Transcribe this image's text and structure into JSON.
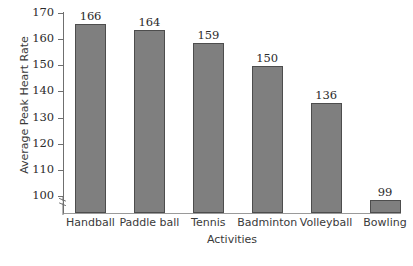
{
  "chart_data": {
    "type": "bar",
    "title": "",
    "subtitle": "",
    "xlabel": "Activities",
    "ylabel": "Average Peak Heart Rate",
    "categories": [
      "Handball",
      "Paddle ball",
      "Tennis",
      "Badminton",
      "Volleyball",
      "Bowling"
    ],
    "values": [
      166,
      164,
      159,
      150,
      136,
      99
    ],
    "value_labels": [
      "166",
      "164",
      "159",
      "150",
      "136",
      "99"
    ],
    "yticks": [
      100,
      110,
      120,
      130,
      140,
      150,
      160,
      170
    ],
    "ytick_labels": [
      "100",
      "110",
      "120",
      "130",
      "140",
      "150",
      "160",
      "170"
    ],
    "ylim": [
      93,
      170
    ],
    "axis_break": true,
    "axis_break_note": "y-axis broken below 100",
    "grid": false,
    "legend": null,
    "legend_position": "none",
    "bar_color": "#7f7f7f",
    "bar_edge_color": "#4d4d4d",
    "axis_color": "#6f6f6f",
    "text_color": "#2b2b2b",
    "background": "#ffffff"
  }
}
